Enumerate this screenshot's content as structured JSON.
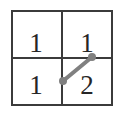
{
  "figure": {
    "background_color": "#ffffff",
    "width": 126,
    "height": 117
  },
  "grid": {
    "line_color": "#3b3b3b",
    "outer_border_width": 2,
    "inner_divider_width": 2,
    "bounds": {
      "x": 11,
      "y": 10,
      "width": 102,
      "height": 96
    },
    "rows": 2,
    "columns": 2,
    "divider_x": 62,
    "divider_y": 58,
    "cells": [
      {
        "name": "top-left",
        "row": 0,
        "col": 0,
        "value": "1"
      },
      {
        "name": "top-right",
        "row": 0,
        "col": 1,
        "value": "1"
      },
      {
        "name": "bottom-left",
        "row": 1,
        "col": 0,
        "value": "1"
      },
      {
        "name": "bottom-right",
        "row": 1,
        "col": 1,
        "value": "2"
      }
    ]
  },
  "segment": {
    "name": "diagonal-segment",
    "color": "#808080",
    "stroke_width": 4,
    "endpoint_radius": 4,
    "start": {
      "x": 63,
      "y": 81
    },
    "end": {
      "x": 92,
      "y": 57
    },
    "located_in_cell": "bottom-right"
  },
  "chart_data": {
    "type": "heatmap",
    "title": "",
    "xlabel": "",
    "ylabel": "",
    "categories": [
      "col-0",
      "col-1"
    ],
    "row_labels": [
      "row-0",
      "row-1"
    ],
    "values": [
      [
        1,
        1
      ],
      [
        1,
        2
      ]
    ],
    "annotations": [
      {
        "kind": "line-segment",
        "color": "#808080",
        "from": [
          63,
          81
        ],
        "to": [
          92,
          57
        ],
        "endpoints": "round-dots",
        "cell": [
          1,
          1
        ]
      }
    ],
    "grid": true,
    "legend": "none"
  }
}
